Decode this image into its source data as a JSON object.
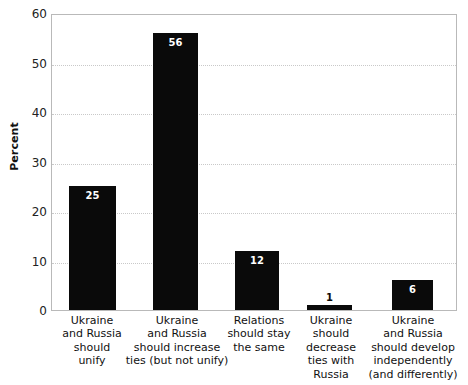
{
  "chart_data": {
    "type": "bar",
    "title": "",
    "xlabel": "",
    "ylabel": "Percent",
    "ylim": [
      0,
      60
    ],
    "yticks": [
      0,
      10,
      20,
      30,
      40,
      50,
      60
    ],
    "ytick_labels": [
      "0",
      "10",
      "20",
      "30",
      "40",
      "50",
      "60"
    ],
    "grid": true,
    "grid_style": "dotted",
    "grid_axis": "y",
    "legend": false,
    "bar_color": "#0a0a0a",
    "value_label_color_inside": "#ffffff",
    "value_label_color_outside": "#0a0a0a",
    "categories": [
      "Ukraine\nand Russia\nshould\nunify",
      "Ukraine\nand Russia\nshould increase\nties (but not unify)",
      "Relations\nshould stay\nthe same",
      "Ukraine\nshould\ndecrease\nties with\nRussia",
      "Ukraine\nand Russia\nshould develop\nindependently\n(and differently)"
    ],
    "values": [
      25,
      56,
      12,
      1,
      6
    ],
    "value_labels": [
      "25",
      "56",
      "12",
      "1",
      "6"
    ]
  },
  "axis": {
    "y_title": "Percent"
  }
}
